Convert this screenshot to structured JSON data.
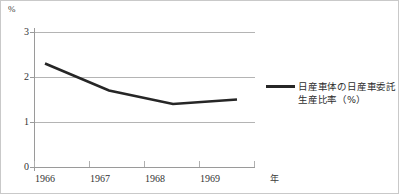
{
  "chart_data": {
    "type": "line",
    "title": "",
    "subtitle": "",
    "xlabel": "年",
    "ylabel": "%",
    "categories": [
      "1966",
      "1967",
      "1968",
      "1969"
    ],
    "x": [
      1966,
      1967,
      1968,
      1969
    ],
    "series": [
      {
        "name": "日産車体の日産車委託生産比率（%）",
        "values": [
          2.3,
          1.7,
          1.4,
          1.5
        ],
        "color": "#262626"
      }
    ],
    "ylim": [
      0,
      3
    ],
    "yticks": [
      "0",
      "1",
      "2",
      "3"
    ],
    "ytick_values": [
      0,
      1,
      2,
      3
    ],
    "xtick_labels": [
      "1966",
      "1967",
      "1968",
      "1969"
    ],
    "grid": true,
    "grid_axis": "y",
    "grid_color": "#b4b4b4",
    "legend_position": "right",
    "legend_entries": [
      "日産車体の日産車委託生産比率（%）"
    ],
    "annotations": []
  },
  "axes": {
    "y_unit_label": "%",
    "x_unit_label": "年"
  },
  "legend": {
    "series_label_line1": "日産車体の日産車委託",
    "series_label_line2": "生産比率（%）"
  },
  "colors": {
    "series_line": "#262626",
    "gridline": "#b4b4b4",
    "axis": "#9a9a9a",
    "text": "#333333",
    "frame": "#c9c9c9",
    "background": "#ffffff"
  }
}
